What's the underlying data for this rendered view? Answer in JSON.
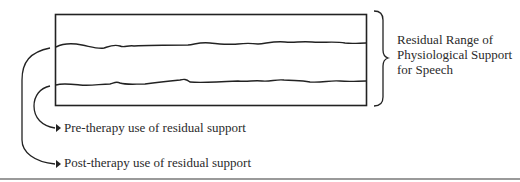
{
  "diagram": {
    "range_label": {
      "line1": "Residual Range of",
      "line2": "Physiological Support",
      "line3": "for Speech"
    },
    "arrows": [
      {
        "label": "Pre-therapy use of residual support",
        "points_to": "lower wavy line"
      },
      {
        "label": "Post-therapy use of residual support",
        "points_to": "upper wavy line"
      }
    ],
    "elements": {
      "box": "rectangle representing residual range",
      "upper_line": "upper wavy boundary",
      "lower_line": "lower wavy boundary",
      "brace": "right curly brace spanning box"
    },
    "colors": {
      "ink": "#222222",
      "rule": "#9a9a9a"
    }
  }
}
